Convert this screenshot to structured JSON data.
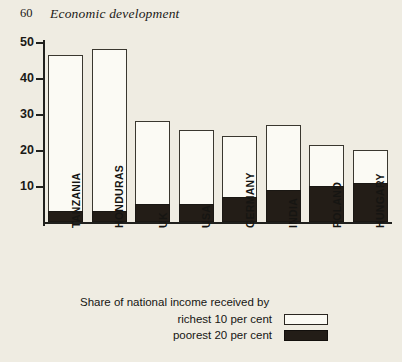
{
  "page": {
    "folio": "60",
    "running_head": "Economic development"
  },
  "chart_data": {
    "type": "bar",
    "subtype": "stacked",
    "title": "",
    "xlabel": "",
    "ylabel": "",
    "ylim": [
      0,
      50
    ],
    "yticks": [
      10,
      20,
      30,
      40,
      50
    ],
    "ytick_labels": [
      "10",
      "20",
      "30",
      "40",
      "50"
    ],
    "grid": false,
    "legend_position": "bottom",
    "categories": [
      "TANZANIA",
      "HONDURAS",
      "UK",
      "USA",
      "GERMANY",
      "INDIA",
      "POLAND",
      "HUNGARY"
    ],
    "series": [
      {
        "name": "richest 10 per cent",
        "color": "#fbfaf4",
        "values": [
          46.5,
          48,
          28,
          25.5,
          24,
          27,
          21.5,
          20
        ]
      },
      {
        "name": "poorest 20 per cent",
        "color": "#231d17",
        "values": [
          3,
          3,
          5,
          5,
          7,
          9,
          10,
          11
        ]
      }
    ],
    "legend": {
      "title": "Share of national income received by",
      "entries": [
        {
          "label": "richest 10 per cent",
          "swatch": "white"
        },
        {
          "label": "poorest 20 per cent",
          "swatch": "black"
        }
      ]
    }
  }
}
